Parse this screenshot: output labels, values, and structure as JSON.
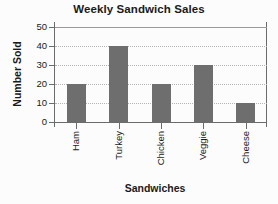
{
  "chart_data": {
    "type": "bar",
    "title": "Weekly Sandwich Sales",
    "xlabel": "Sandwiches",
    "ylabel": "Number Sold",
    "categories": [
      "Ham",
      "Turkey",
      "Chicken",
      "Veggie",
      "Cheese"
    ],
    "values": [
      20,
      40,
      20,
      30,
      10
    ],
    "ylim": [
      0,
      50
    ],
    "yticks": [
      0,
      10,
      20,
      30,
      40,
      50
    ],
    "ytick_labels": [
      "0",
      "10",
      "20",
      "30",
      "40",
      "50"
    ],
    "grid": true,
    "grid_axis": "y",
    "grid_style": "dotted",
    "legend": false,
    "bar_color": "#6e6e6e",
    "axis_color": "#6b6b6b",
    "gridline_color": "#b4b4b4",
    "background_color": "#fcfcfc",
    "text_color": "#1a1a1a",
    "category_label_rotation": -90,
    "ylabel_rotation": -90
  }
}
